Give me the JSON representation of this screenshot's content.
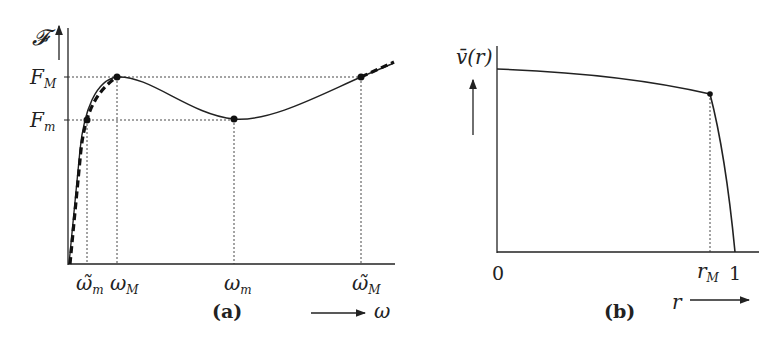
{
  "figure": {
    "panel_a": {
      "caption": "(a)",
      "y_axis_label": "𝓕",
      "x_axis_label": "ω",
      "y_ticks": [
        {
          "main": "F",
          "sub": "M"
        },
        {
          "main": "F",
          "sub": "m"
        }
      ],
      "x_ticks": [
        {
          "main": "ω̃",
          "sub": "m"
        },
        {
          "main": "ω",
          "sub": "M"
        },
        {
          "main": "ω",
          "sub": "m"
        },
        {
          "main": "ω̃",
          "sub": "M"
        }
      ],
      "points": [
        "(ω̃_m, F_m)",
        "(ω_M, F_M)",
        "(ω_m, F_m)",
        "(ω̃_M, F_M)"
      ],
      "curves": [
        "solid: non-monotone F(ω) with local max at ω_M and local min at ω_m",
        "dashed: monotone envelope"
      ]
    },
    "panel_b": {
      "caption": "(b)",
      "y_axis_label": "v̄(r)",
      "x_axis_label": "r",
      "x_ticks": [
        {
          "main": "0",
          "sub": ""
        },
        {
          "main": "r",
          "sub": "M"
        },
        {
          "main": "1",
          "sub": ""
        }
      ],
      "points": [
        "r_M"
      ]
    }
  },
  "colors": {
    "ink": "#222222",
    "background": "#ffffff"
  }
}
